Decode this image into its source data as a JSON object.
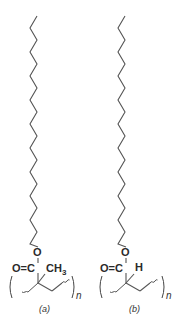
{
  "figure": {
    "type": "chemical-structure-diagram",
    "line_color": "#555555",
    "text_color": "#2a2a2a"
  },
  "structures": [
    {
      "id": "a",
      "label": "(a)",
      "label_letter": "a",
      "repeat_subscript": "n",
      "atoms": {
        "ester_oxygen": "O",
        "carbonyl": "O=C",
        "substituent": "CH",
        "substituent_sub": "3"
      },
      "chain_x": [
        37,
        30
      ],
      "offset_x": 0
    },
    {
      "id": "b",
      "label": "(b)",
      "label_letter": "b",
      "repeat_subscript": "n",
      "atoms": {
        "ester_oxygen": "O",
        "carbonyl": "O=C",
        "substituent": "H",
        "substituent_sub": ""
      },
      "chain_x": [
        125,
        118
      ],
      "offset_x": 88
    }
  ],
  "chain": {
    "top_y": 16,
    "bottom_y": 244,
    "segments": 19
  }
}
